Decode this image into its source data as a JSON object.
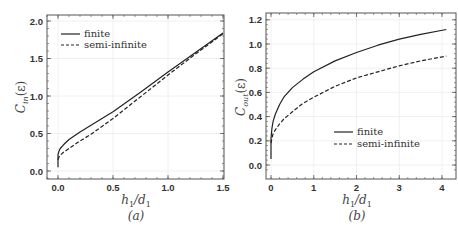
{
  "chart_data": [
    {
      "type": "line",
      "panel": "a",
      "caption": "(a)",
      "xlabel": "h_1/d_1",
      "ylabel": "C_in(ε)",
      "xlim": [
        -0.08,
        1.5
      ],
      "ylim": [
        -0.1,
        2.1
      ],
      "xticks": [
        "0.0",
        "0.5",
        "1.0",
        "1.5"
      ],
      "yticks": [
        "0.0",
        "0.5",
        "1.0",
        "1.5",
        "2.0"
      ],
      "grid": true,
      "legend_position": "upper left",
      "series": [
        {
          "name": "finite",
          "style": "solid",
          "x": [
            0.0,
            0.0,
            0.01,
            0.02,
            0.05,
            0.1,
            0.2,
            0.3,
            0.5,
            0.75,
            1.0,
            1.25,
            1.5
          ],
          "y": [
            0.05,
            0.22,
            0.27,
            0.3,
            0.35,
            0.42,
            0.52,
            0.61,
            0.79,
            1.05,
            1.32,
            1.58,
            1.84
          ]
        },
        {
          "name": "semi-infinite",
          "style": "dashed",
          "x": [
            0.0,
            0.01,
            0.02,
            0.05,
            0.1,
            0.2,
            0.3,
            0.5,
            0.75,
            1.0,
            1.25,
            1.5
          ],
          "y": [
            0.15,
            0.19,
            0.21,
            0.25,
            0.3,
            0.4,
            0.49,
            0.7,
            0.99,
            1.28,
            1.56,
            1.83
          ]
        }
      ]
    },
    {
      "type": "line",
      "panel": "b",
      "caption": "(b)",
      "xlabel": "h_1/d_1",
      "ylabel": "C_out(ε)",
      "xlim": [
        -0.1,
        4.1
      ],
      "ylim": [
        -0.1,
        1.25
      ],
      "xticks": [
        "0",
        "1",
        "2",
        "3",
        "4"
      ],
      "yticks": [
        "0.0",
        "0.2",
        "0.4",
        "0.6",
        "0.8",
        "1.0",
        "1.2"
      ],
      "grid": true,
      "legend_position": "lower right",
      "series": [
        {
          "name": "finite",
          "style": "solid",
          "x": [
            0.0,
            0.0,
            0.02,
            0.05,
            0.1,
            0.2,
            0.3,
            0.5,
            0.75,
            1.0,
            1.5,
            2.0,
            2.5,
            3.0,
            3.5,
            4.1
          ],
          "y": [
            0.05,
            0.22,
            0.3,
            0.36,
            0.42,
            0.5,
            0.56,
            0.64,
            0.71,
            0.77,
            0.86,
            0.93,
            0.99,
            1.04,
            1.08,
            1.12
          ]
        },
        {
          "name": "semi-infinite",
          "style": "dashed",
          "x": [
            0.0,
            0.02,
            0.05,
            0.1,
            0.2,
            0.3,
            0.5,
            0.75,
            1.0,
            1.5,
            2.0,
            2.5,
            3.0,
            3.5,
            4.1
          ],
          "y": [
            0.18,
            0.22,
            0.26,
            0.29,
            0.34,
            0.38,
            0.44,
            0.51,
            0.56,
            0.65,
            0.72,
            0.77,
            0.82,
            0.86,
            0.9
          ]
        }
      ]
    }
  ],
  "panels": {
    "a": {
      "caption": "(a)",
      "xlabel_main": "h",
      "xlabel_sub1": "1",
      "xlabel_slash": "/d",
      "xlabel_sub2": "1",
      "ylabel_main": "C",
      "ylabel_sub": "in",
      "ylabel_arg": "(ε)",
      "legend": [
        "finite",
        "semi-infinite"
      ]
    },
    "b": {
      "caption": "(b)",
      "xlabel_main": "h",
      "xlabel_sub1": "1",
      "xlabel_slash": "/d",
      "xlabel_sub2": "1",
      "ylabel_main": "C",
      "ylabel_sub": "out",
      "ylabel_arg": "(ε)",
      "legend": [
        "finite",
        "semi-infinite"
      ]
    }
  }
}
